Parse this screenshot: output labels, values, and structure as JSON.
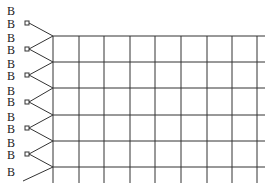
{
  "diagram": {
    "type": "lattice-with-boundary-nodes",
    "labels": [
      "B",
      "B",
      "B",
      "B",
      "B",
      "B",
      "B",
      "B",
      "B",
      "B",
      "B",
      "B",
      "B"
    ],
    "label_positions": [
      {
        "x": 7,
        "y": 11
      },
      {
        "x": 7,
        "y": 24
      },
      {
        "x": 7,
        "y": 38
      },
      {
        "x": 7,
        "y": 50
      },
      {
        "x": 7,
        "y": 64
      },
      {
        "x": 7,
        "y": 76
      },
      {
        "x": 7,
        "y": 91
      },
      {
        "x": 7,
        "y": 102
      },
      {
        "x": 7,
        "y": 117
      },
      {
        "x": 7,
        "y": 129
      },
      {
        "x": 7,
        "y": 143
      },
      {
        "x": 7,
        "y": 155
      },
      {
        "x": 7,
        "y": 172
      }
    ],
    "grid": {
      "columns_x": [
        53,
        79,
        104,
        130,
        155,
        181,
        207,
        232,
        257
      ],
      "rows_y": [
        36,
        62,
        88,
        115,
        141,
        167
      ],
      "right_edge": 265,
      "bottom_edge": 183,
      "line_color": "#333333"
    },
    "boundary_nodes": [
      {
        "x": 27,
        "y": 23
      },
      {
        "x": 27,
        "y": 49
      },
      {
        "x": 27,
        "y": 75
      },
      {
        "x": 27,
        "y": 102
      },
      {
        "x": 27,
        "y": 128
      },
      {
        "x": 27,
        "y": 154
      }
    ]
  }
}
